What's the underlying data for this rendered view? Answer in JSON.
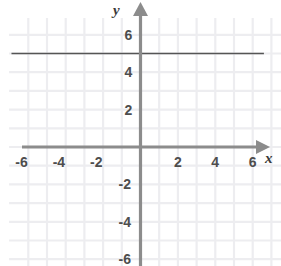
{
  "chart_data": {
    "type": "line",
    "title": "",
    "xlabel": "x",
    "ylabel": "y",
    "xlim": [
      -7.0,
      7.4
    ],
    "ylim": [
      -7.2,
      7.2
    ],
    "grid": true,
    "grid_step": 1,
    "legend": "none",
    "x_tick_labels": [
      "-6",
      "-4",
      "-2",
      "2",
      "4",
      "6"
    ],
    "x_tick_values": [
      -6,
      -4,
      -2,
      2,
      4,
      6
    ],
    "y_tick_labels": [
      "6",
      "4",
      "2",
      "-2",
      "-4",
      "-6"
    ],
    "y_tick_values": [
      6,
      4,
      2,
      -2,
      -4,
      -6
    ],
    "series": [
      {
        "name": "horizontal-line",
        "equation": "y = 5",
        "x": [
          -6.9,
          6.6
        ],
        "values": [
          5,
          5
        ],
        "color": "#555555"
      }
    ]
  },
  "axes": {
    "x_axis_label": "x",
    "y_axis_label": "y",
    "x_axis_arrow_icon": "arrow-right-icon",
    "y_axis_arrow_icon": "arrow-up-icon",
    "axis_color": "#8c8c8c",
    "grid_color": "#ededf0",
    "line_color": "#555555",
    "tick_text_color": "#4d4d4d"
  },
  "ticks": {
    "x": [
      {
        "label": "-6",
        "value": -6
      },
      {
        "label": "-4",
        "value": -4
      },
      {
        "label": "-2",
        "value": -2
      },
      {
        "label": "2",
        "value": 2
      },
      {
        "label": "4",
        "value": 4
      },
      {
        "label": "6",
        "value": 6
      }
    ],
    "y": [
      {
        "label": "6",
        "value": 6
      },
      {
        "label": "4",
        "value": 4
      },
      {
        "label": "2",
        "value": 2
      },
      {
        "label": "-2",
        "value": -2
      },
      {
        "label": "-4",
        "value": -4
      },
      {
        "label": "-6",
        "value": -6
      }
    ]
  }
}
